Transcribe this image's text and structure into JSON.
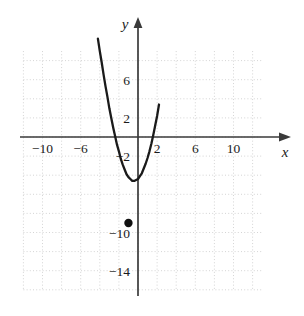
{
  "figure": {
    "background_color": "#ffffff",
    "grid_color": "#c9c9c9",
    "axis_color": "#3a3a3a",
    "curve_color": "#1a1a1a",
    "point_color": "#111111"
  },
  "axis_names": {
    "x": "x",
    "y": "y"
  },
  "chart_data": {
    "type": "line",
    "title": "",
    "xlabel": "x",
    "ylabel": "y",
    "grid": true,
    "legend": null,
    "xlim": [
      -12,
      13
    ],
    "ylim": [
      -16,
      9
    ],
    "x_ticks": [
      -10,
      -6,
      2,
      6,
      10
    ],
    "x_tick_labels": [
      "−10",
      "−6",
      "2",
      "6",
      "10"
    ],
    "y_ticks": [
      6,
      2,
      -2,
      -10,
      -14
    ],
    "y_tick_labels": [
      "6",
      "2",
      "−2",
      "−10",
      "−14"
    ],
    "grid_step": 2,
    "curve": {
      "name": "parabola",
      "equation": "y = 2x^2 + 4x - 7",
      "opens": "up",
      "vertex": [
        -1,
        -9
      ],
      "x_intercepts": [
        -3.12,
        1.12
      ],
      "y_intercept": -7,
      "x": [
        -4.2,
        -4.0,
        -3.8,
        -3.6,
        -3.4,
        -3.2,
        -3.0,
        -2.8,
        -2.6,
        -2.4,
        -2.2,
        -2.0,
        -1.8,
        -1.6,
        -1.4,
        -1.2,
        -1.0,
        -0.8,
        -0.6,
        -0.4,
        -0.2,
        0.0,
        0.2,
        0.4,
        0.6,
        0.8,
        1.0,
        1.2,
        1.4,
        1.6,
        1.8,
        2.0,
        2.2
      ],
      "y": [
        10.3,
        9.0,
        7.8,
        6.5,
        5.3,
        4.2,
        3.0,
        2.0,
        1.0,
        0.1,
        -0.8,
        -1.5,
        -2.3,
        -2.9,
        -3.4,
        -3.9,
        -4.2,
        -4.4,
        -4.6,
        -4.6,
        -4.5,
        -4.4,
        -4.1,
        -3.8,
        -3.3,
        -2.8,
        -2.2,
        -1.5,
        -0.7,
        0.2,
        1.2,
        2.2,
        3.4
      ]
    },
    "marked_point": {
      "label": "vertex",
      "x": -1,
      "y": -9,
      "style": "filled-dot"
    },
    "annotations": []
  }
}
